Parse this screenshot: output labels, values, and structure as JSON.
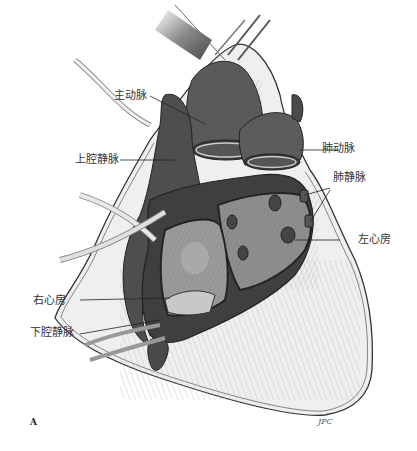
{
  "figure": {
    "panel_label": "A",
    "signature": "JPC",
    "labels": {
      "aorta": "主动脉",
      "superior_vena_cava": "上腔静脉",
      "pulmonary_artery": "肺动脉",
      "pulmonary_veins": "肺静脉",
      "left_atrium": "左心房",
      "right_atrium": "右心房",
      "inferior_vena_cava": "下腔静脉"
    },
    "colors": {
      "background": "#ffffff",
      "pericardium_fill": "#efefef",
      "heart_dark": "#4a4a4a",
      "heart_mid": "#7a7a7a",
      "atrium_light": "#9a9a9a",
      "line": "#222222"
    }
  }
}
